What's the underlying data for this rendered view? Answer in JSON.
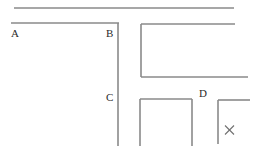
{
  "figure": {
    "width": 262,
    "height": 146,
    "background_color": "#ffffff",
    "line_color": "#8a8a8a",
    "label_color": "#2b2b2b",
    "line_width": 1.6
  },
  "labels": [
    {
      "id": "A",
      "text": "A",
      "x": 11,
      "y": 28
    },
    {
      "id": "B",
      "text": "B",
      "x": 106,
      "y": 28
    },
    {
      "id": "C",
      "text": "C",
      "x": 106,
      "y": 92
    },
    {
      "id": "D",
      "text": "D",
      "x": 199,
      "y": 88
    },
    {
      "id": "X",
      "text": "×",
      "x": 225,
      "y": 125
    }
  ],
  "segments": [
    {
      "id": "top-rule",
      "type": "horizontal",
      "x1": 14,
      "y1": 8,
      "x2": 234,
      "y2": 8
    },
    {
      "id": "segment-ab",
      "type": "horizontal",
      "x1": 11,
      "y1": 23,
      "x2": 119,
      "y2": 23
    },
    {
      "id": "segment-bc-vertical",
      "type": "vertical",
      "x1": 118,
      "y1": 23,
      "x2": 118,
      "y2": 146
    },
    {
      "id": "bracket-top",
      "type": "horizontal",
      "x1": 141,
      "y1": 24,
      "x2": 235,
      "y2": 24
    },
    {
      "id": "bracket-left",
      "type": "vertical",
      "x1": 141,
      "y1": 24,
      "x2": 141,
      "y2": 77
    },
    {
      "id": "bracket-bottom",
      "type": "horizontal",
      "x1": 141,
      "y1": 77,
      "x2": 248,
      "y2": 77
    },
    {
      "id": "ushape-top",
      "type": "horizontal",
      "x1": 140,
      "y1": 99,
      "x2": 192,
      "y2": 99
    },
    {
      "id": "ushape-left",
      "type": "vertical",
      "x1": 140,
      "y1": 99,
      "x2": 140,
      "y2": 146
    },
    {
      "id": "ushape-right",
      "type": "vertical",
      "x1": 192,
      "y1": 99,
      "x2": 192,
      "y2": 146
    },
    {
      "id": "corner-vertical",
      "type": "vertical",
      "x1": 218,
      "y1": 100,
      "x2": 218,
      "y2": 144
    },
    {
      "id": "corner-top",
      "type": "horizontal",
      "x1": 218,
      "y1": 100,
      "x2": 250,
      "y2": 100
    }
  ],
  "marks": [
    {
      "id": "x-mark",
      "type": "cross",
      "cx": 229.5,
      "cy": 130,
      "size": 4.5
    }
  ]
}
